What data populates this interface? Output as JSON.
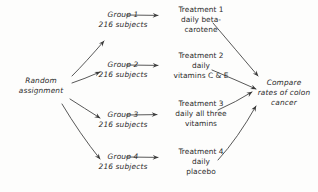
{
  "diagram": {
    "style": "hand-drawn",
    "ink_color": "#3a3a3a",
    "background_color": "#fdfdfc",
    "source": {
      "id": "random-assignment",
      "lines": [
        "Random",
        "assignment"
      ]
    },
    "groups": [
      {
        "id": "group-1",
        "name": "Group 1",
        "subjects": "216 subjects"
      },
      {
        "id": "group-2",
        "name": "Group 2",
        "subjects": "216 subjects"
      },
      {
        "id": "group-3",
        "name": "Group 3",
        "subjects": "216 subjects"
      },
      {
        "id": "group-4",
        "name": "Group 4",
        "subjects": "216 subjects"
      }
    ],
    "treatments": [
      {
        "id": "treatment-1",
        "name": "Treatment 1",
        "lines": [
          "Treatment 1",
          "daily beta-",
          "carotene"
        ]
      },
      {
        "id": "treatment-2",
        "name": "Treatment 2",
        "lines": [
          "Treatment 2",
          "daily",
          "vitamins C & E"
        ]
      },
      {
        "id": "treatment-3",
        "name": "Treatment 3",
        "lines": [
          "Treatment 3",
          "daily all three",
          "vitamins"
        ]
      },
      {
        "id": "treatment-4",
        "name": "Treatment 4",
        "lines": [
          "Treatment 4",
          "daily",
          "placebo"
        ]
      }
    ],
    "outcome": {
      "id": "compare-outcome",
      "lines": [
        "Compare",
        "rates of colon",
        "cancer"
      ]
    },
    "edges": [
      {
        "id": "edge-random-group1",
        "from": "random-assignment",
        "to": "group-1",
        "kind": "arrow"
      },
      {
        "id": "edge-random-group2",
        "from": "random-assignment",
        "to": "group-2",
        "kind": "arrow"
      },
      {
        "id": "edge-random-group3",
        "from": "random-assignment",
        "to": "group-3",
        "kind": "arrow"
      },
      {
        "id": "edge-random-group4",
        "from": "random-assignment",
        "to": "group-4",
        "kind": "arrow"
      },
      {
        "id": "edge-group1-treatment1",
        "from": "group-1",
        "to": "treatment-1",
        "kind": "arrow"
      },
      {
        "id": "edge-group2-treatment2",
        "from": "group-2",
        "to": "treatment-2",
        "kind": "arrow"
      },
      {
        "id": "edge-group3-treatment3",
        "from": "group-3",
        "to": "treatment-3",
        "kind": "arrow"
      },
      {
        "id": "edge-group4-treatment4",
        "from": "group-4",
        "to": "treatment-4",
        "kind": "arrow"
      },
      {
        "id": "edge-treatment1-compare",
        "from": "treatment-1",
        "to": "compare-outcome",
        "kind": "arrow"
      },
      {
        "id": "edge-treatment2-compare",
        "from": "treatment-2",
        "to": "compare-outcome",
        "kind": "arrow"
      },
      {
        "id": "edge-treatment3-compare",
        "from": "treatment-3",
        "to": "compare-outcome",
        "kind": "arrow"
      },
      {
        "id": "edge-treatment4-compare",
        "from": "treatment-4",
        "to": "compare-outcome",
        "kind": "arrow"
      }
    ]
  }
}
